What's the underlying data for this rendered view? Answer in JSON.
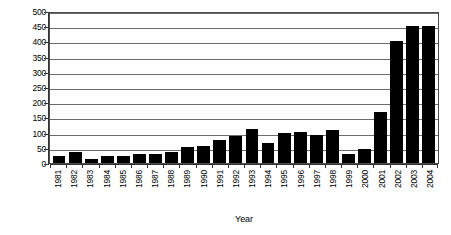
{
  "chart_data": {
    "type": "bar",
    "title": "",
    "subtitle": "",
    "xlabel": "Year",
    "ylabel": "(in B$)",
    "categories": [
      "1981",
      "1982",
      "1983",
      "1984",
      "1985",
      "1986",
      "1987",
      "1988",
      "1989",
      "1990",
      "1991",
      "1992",
      "1993",
      "1994",
      "1995",
      "1996",
      "1997",
      "1998",
      "1999",
      "2000",
      "2001",
      "2002",
      "2003",
      "2004"
    ],
    "values": [
      25,
      38,
      14,
      22,
      24,
      30,
      31,
      38,
      53,
      58,
      78,
      89,
      114,
      67,
      100,
      105,
      95,
      110,
      29,
      46,
      171,
      408,
      457,
      457
    ],
    "ylim": [
      0,
      500
    ],
    "ytick_step": 50,
    "ytick_labels": [
      "0",
      "50",
      "100",
      "150",
      "200",
      "250",
      "300",
      "350",
      "400",
      "450",
      "500"
    ],
    "grid": true,
    "grid_axis": "y",
    "legend": false,
    "legend_position": "none",
    "bar_color": "#000000",
    "grid_color": "#6b6b6b",
    "axis_color": "#333333",
    "background_color": "#ffffff",
    "series": [
      {
        "name": "value",
        "values": [
          25,
          38,
          14,
          22,
          24,
          30,
          31,
          38,
          53,
          58,
          78,
          89,
          114,
          67,
          100,
          105,
          95,
          110,
          29,
          46,
          171,
          408,
          457,
          457
        ]
      }
    ]
  }
}
